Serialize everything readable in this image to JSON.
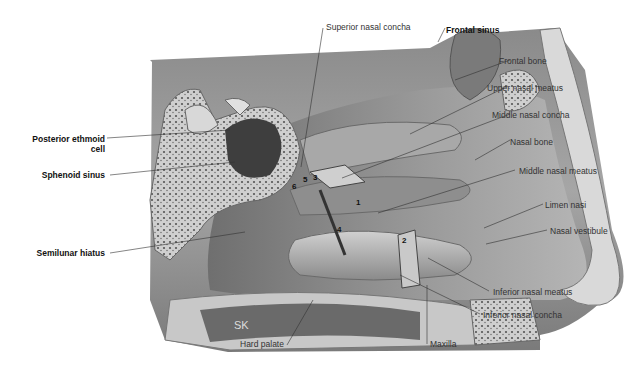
{
  "figure": {
    "artist_initials": "SK",
    "labels": {
      "superior_nasal_concha": "Superior nasal concha",
      "frontal_sinus": "Frontal sinus",
      "frontal_bone": "Frontal bone",
      "upper_nasal_meatus": "Upper nasal meatus",
      "middle_nasal_concha": "Middle nasal concha",
      "nasal_bone": "Nasal bone",
      "middle_nasal_meatus": "Middle nasal meatus",
      "limen_nasi": "Limen nasi",
      "nasal_vestibule": "Nasal vestibule",
      "inferior_nasal_meatus": "Inferior nasal meatus",
      "inferior_nasal_concha": "Inferior nasal concha",
      "maxilla": "Maxilla",
      "hard_palate": "Hard palate",
      "posterior_ethmoid_cell_line1": "Posterior ethmoid",
      "posterior_ethmoid_cell_line2": "cell",
      "sphenoid_sinus": "Sphenoid sinus",
      "semilunar_hiatus": "Semilunar hiatus"
    },
    "numbers": [
      "1",
      "2",
      "3",
      "4",
      "5",
      "6"
    ],
    "colors": {
      "background": "#ffffff",
      "tissue_dark": "#5a5a5a",
      "tissue_mid": "#9a9a9a",
      "tissue_light": "#d6d6d6",
      "leader_line": "#333333"
    }
  }
}
